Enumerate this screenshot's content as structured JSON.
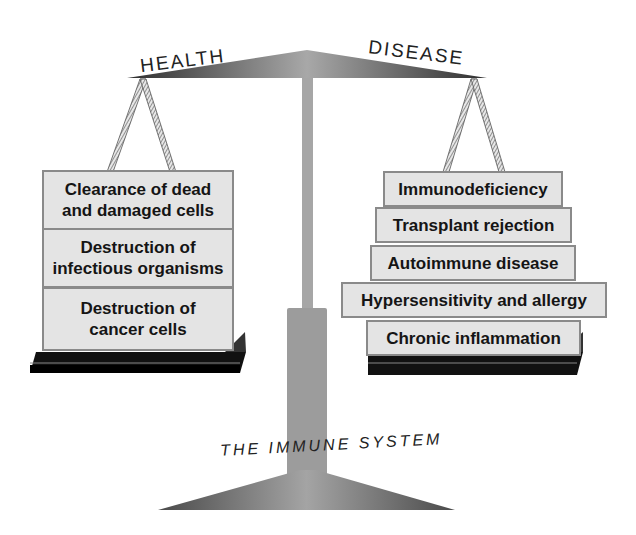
{
  "title_left": "HEALTH",
  "title_right": "DISEASE",
  "base_label": "THE IMMUNE SYSTEM",
  "health_blocks": [
    {
      "line1": "Clearance of dead",
      "line2": "and damaged cells"
    },
    {
      "line1": "Destruction of",
      "line2": "infectious organisms"
    },
    {
      "line1": "Destruction of",
      "line2": "cancer cells"
    }
  ],
  "disease_blocks": [
    "Immunodeficiency",
    "Transplant rejection",
    "Autoimmune disease",
    "Hypersensitivity and allergy",
    "Chronic inflammation"
  ],
  "colors": {
    "beam": "#6e6e6e",
    "block_fill": "#e4e4e4",
    "block_border": "#8a8a8a",
    "platform": "#111111",
    "column": "#a0a0a0"
  }
}
